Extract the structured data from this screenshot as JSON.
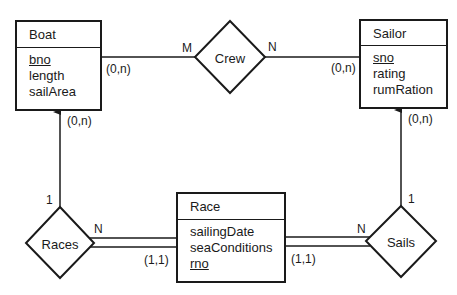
{
  "diagram": {
    "type": "ER diagram",
    "entities": [
      {
        "id": "boat",
        "name": "Boat",
        "attributes": [
          {
            "name": "bno",
            "key": true
          },
          {
            "name": "length",
            "key": false
          },
          {
            "name": "sailArea",
            "key": false
          }
        ]
      },
      {
        "id": "sailor",
        "name": "Sailor",
        "attributes": [
          {
            "name": "sno",
            "key": true
          },
          {
            "name": "rating",
            "key": false
          },
          {
            "name": "rumRation",
            "key": false
          }
        ]
      },
      {
        "id": "race",
        "name": "Race",
        "attributes": [
          {
            "name": "sailingDate",
            "key": false
          },
          {
            "name": "seaConditions",
            "key": false
          },
          {
            "name": "rno",
            "key": true
          }
        ]
      }
    ],
    "relationships": [
      {
        "id": "crew",
        "name": "Crew"
      },
      {
        "id": "races",
        "name": "Races"
      },
      {
        "id": "sails",
        "name": "Sails"
      }
    ],
    "labels": {
      "crew_boat_card": "M",
      "crew_sailor_card": "N",
      "boat_crew_minmax": "(0,n)",
      "sailor_crew_minmax": "(0,n)",
      "boat_races_minmax": "(0,n)",
      "sailor_sails_minmax": "(0,n)",
      "races_boat_card": "1",
      "sails_sailor_card": "1",
      "races_race_card": "N",
      "sails_race_card": "N",
      "race_races_minmax": "(1,1)",
      "race_sails_minmax": "(1,1)"
    }
  }
}
